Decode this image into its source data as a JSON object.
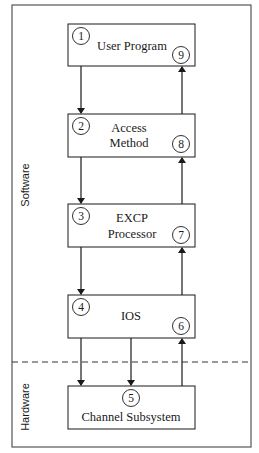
{
  "diagram": {
    "type": "I/O request flow diagram",
    "regions": {
      "software": {
        "label": "Software"
      },
      "hardware": {
        "label": "Hardware"
      }
    },
    "boxes": [
      {
        "id": "user-program",
        "lines": [
          "User Program"
        ],
        "step_in": "1",
        "step_out": "9"
      },
      {
        "id": "access-method",
        "lines": [
          "Access",
          "Method"
        ],
        "step_in": "2",
        "step_out": "8"
      },
      {
        "id": "excp-processor",
        "lines": [
          "EXCP",
          "Processor"
        ],
        "step_in": "3",
        "step_out": "7"
      },
      {
        "id": "ios",
        "lines": [
          "IOS"
        ],
        "step_in": "4",
        "step_out": "6"
      },
      {
        "id": "channel-subsystem",
        "lines": [
          "Channel Subsystem"
        ],
        "step": "5"
      }
    ],
    "arrows": [
      {
        "from": "user-program",
        "to": "access-method",
        "direction": "down"
      },
      {
        "from": "access-method",
        "to": "user-program",
        "direction": "up"
      },
      {
        "from": "access-method",
        "to": "excp-processor",
        "direction": "down"
      },
      {
        "from": "excp-processor",
        "to": "access-method",
        "direction": "up"
      },
      {
        "from": "excp-processor",
        "to": "ios",
        "direction": "down"
      },
      {
        "from": "ios",
        "to": "excp-processor",
        "direction": "up"
      },
      {
        "from": "ios",
        "to": "channel-subsystem",
        "direction": "down"
      },
      {
        "from": "ios",
        "to": "channel-subsystem",
        "direction": "down"
      },
      {
        "from": "channel-subsystem",
        "to": "ios",
        "direction": "up"
      }
    ],
    "colors": {
      "line": "#1a1a1a",
      "frame": "#555555",
      "background": "#ffffff"
    }
  }
}
